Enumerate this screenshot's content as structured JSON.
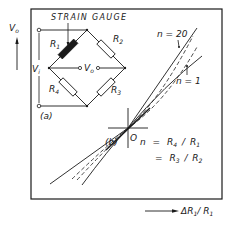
{
  "diagram": {
    "panel_a_label": "(a)",
    "panel_b_label": "(b)",
    "strain_gauge_label": "STRAIN GAUGE",
    "y_axis": {
      "label": "V",
      "subscript": "o"
    },
    "x_axis": {
      "label_prefix": "ΔR",
      "label_sub1": "1",
      "label_mid": "/ R",
      "label_sub2": "1"
    },
    "origin_label": "O",
    "bridge": {
      "resistors": [
        {
          "name": "R",
          "sub": "1",
          "role": "strain gauge (active)"
        },
        {
          "name": "R",
          "sub": "2"
        },
        {
          "name": "R",
          "sub": "3"
        },
        {
          "name": "R",
          "sub": "4"
        }
      ],
      "input_voltage": {
        "name": "V",
        "sub": "i"
      },
      "output_voltage": {
        "name": "V",
        "sub": "o"
      }
    },
    "curves": [
      {
        "label": "n = 20",
        "style": "solid",
        "description": "most linear, steepest"
      },
      {
        "label": "",
        "style": "dashed"
      },
      {
        "label": "",
        "style": "dashed"
      },
      {
        "label": "n = 1",
        "style": "solid",
        "description": "most non-linear"
      }
    ],
    "equation": {
      "line1": {
        "lhs": "n",
        "eq": "=",
        "num": "R",
        "num_sub": "4",
        "den": "R",
        "den_sub": "1"
      },
      "line2": {
        "eq": "=",
        "num": "R",
        "num_sub": "3",
        "den": "R",
        "den_sub": "2"
      }
    },
    "colors": {
      "ink": "#1a1a1a",
      "background": "#ffffff"
    }
  }
}
